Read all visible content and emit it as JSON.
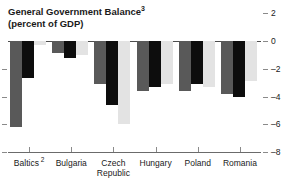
{
  "chart_data": {
    "type": "bar",
    "title": "General Government Balance",
    "title_superscript": "3",
    "subtitle": "(percent of GDP)",
    "xlabel": "",
    "ylabel": "",
    "ylim": [
      -8,
      2
    ],
    "yticks": [
      2,
      0,
      -2,
      -4,
      -6,
      -8
    ],
    "ytick_labels": [
      "2",
      "0",
      "–2",
      "–4",
      "–6",
      "–8"
    ],
    "grid": false,
    "legend": "none",
    "axis_label_position": "right",
    "categories": [
      "Baltics",
      "Bulgaria",
      "Czech Republic",
      "Hungary",
      "Poland",
      "Romania"
    ],
    "category_superscripts": [
      "2",
      "",
      "",
      "",
      "",
      ""
    ],
    "category_lines": [
      [
        "Baltics"
      ],
      [
        "Bulgaria"
      ],
      [
        "Czech",
        "Republic"
      ],
      [
        "Hungary"
      ],
      [
        "Poland"
      ],
      [
        "Romania"
      ]
    ],
    "series": [
      {
        "name": "series-1",
        "color": "#595959",
        "values": [
          -6.2,
          -0.9,
          -3.1,
          -3.6,
          -3.6,
          -3.8
        ]
      },
      {
        "name": "series-2",
        "color": "#0d0d0d",
        "values": [
          -2.7,
          -1.2,
          -4.6,
          -3.3,
          -3.1,
          -4.0
        ]
      },
      {
        "name": "series-3",
        "color": "#e3e3e3",
        "values": [
          -0.3,
          -1.0,
          -6.0,
          -3.1,
          -3.3,
          -2.9
        ]
      }
    ]
  }
}
